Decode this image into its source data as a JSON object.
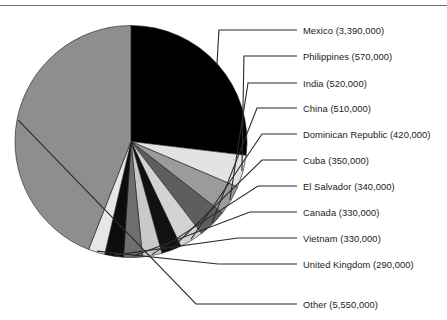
{
  "chart_data": {
    "type": "pie",
    "title": "",
    "xlabel": "",
    "ylabel": "",
    "legend_position": "right-callout-labels",
    "grid": false,
    "units": "people",
    "total": 12230000,
    "start_angle_deg": 0,
    "direction": "clockwise",
    "categories": [
      "Mexico",
      "Philippines",
      "India",
      "China",
      "Dominican Republic",
      "Cuba",
      "El Salvador",
      "Canada",
      "Vietnam",
      "United Kingdom",
      "Other"
    ],
    "values": [
      3390000,
      570000,
      520000,
      510000,
      420000,
      350000,
      340000,
      330000,
      330000,
      290000,
      5550000
    ],
    "value_labels": [
      "3,390,000",
      "570,000",
      "520,000",
      "510,000",
      "420,000",
      "350,000",
      "340,000",
      "330,000",
      "330,000",
      "290,000",
      "5,550,000"
    ],
    "slice_colors": [
      "#000000",
      "#e2e2e2",
      "#9b9b9b",
      "#5e5e5e",
      "#d2d2d2",
      "#111111",
      "#c9c9c9",
      "#6e6e6e",
      "#0d0d0d",
      "#e6e6e6",
      "#8e8e8e"
    ],
    "annotations": []
  },
  "callouts": [
    {
      "label": "Mexico (3,390,000)"
    },
    {
      "label": "Philippines (570,000)"
    },
    {
      "label": "India (520,000)"
    },
    {
      "label": "China (510,000)"
    },
    {
      "label": "Dominican Republic (420,000)"
    },
    {
      "label": "Cuba (350,000)"
    },
    {
      "label": "El Salvador (340,000)"
    },
    {
      "label": "Canada (330,000)"
    },
    {
      "label": "Vietnam (330,000)"
    },
    {
      "label": "United Kingdom (290,000)"
    },
    {
      "label": "Other (5,550,000)"
    }
  ],
  "footer": {
    "caption": ""
  }
}
